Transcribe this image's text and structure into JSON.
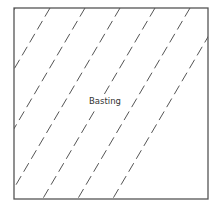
{
  "diagram": {
    "label": "Basting",
    "stroke_color": "#555555",
    "line_style": "dashed",
    "line_count": 11
  }
}
